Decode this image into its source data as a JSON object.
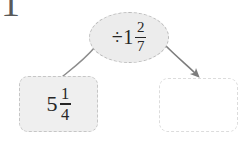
{
  "diagram": {
    "type": "function-machine",
    "title_fragment": "1",
    "operator": {
      "label": "÷ 1 2/7",
      "symbol": "÷",
      "whole": "1",
      "numerator": "2",
      "denominator": "7",
      "shape": "ellipse",
      "fill": "#ececec",
      "border": "#b9b9b9"
    },
    "input": {
      "label": "5 1/4",
      "whole": "5",
      "numerator": "1",
      "denominator": "4",
      "shape": "rounded-rect",
      "fill": "#efefef",
      "border": "#c6c6c6"
    },
    "output": {
      "label": "",
      "placeholder": "",
      "shape": "rounded-rect",
      "fill": "#ffffff",
      "border": "#dcdcdc",
      "state": "empty"
    },
    "connectors": [
      {
        "name": "operator-to-input",
        "from": "operator",
        "to": "input",
        "arrowhead": false,
        "color": "#8c8c8c"
      },
      {
        "name": "operator-to-output",
        "from": "operator",
        "to": "output",
        "arrowhead": true,
        "color": "#7d7d7d"
      }
    ]
  }
}
